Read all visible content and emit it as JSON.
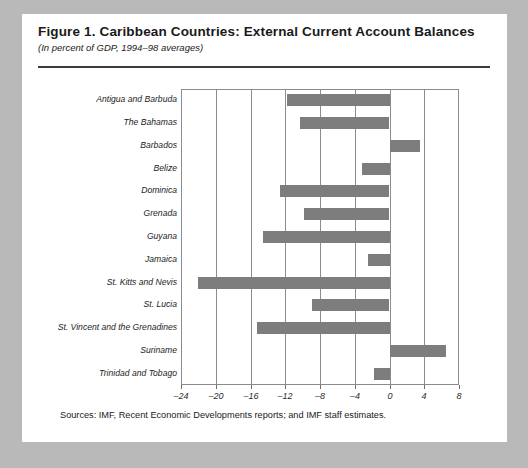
{
  "figure": {
    "title": "Figure 1.  Caribbean Countries: External Current Account Balances",
    "subtitle": "(In percent of GDP, 1994–98 averages)",
    "source_note": "Sources: IMF, Recent Economic Developments reports; and IMF staff estimates."
  },
  "colors": {
    "page_background": "#b9b9b9",
    "card_background": "#ffffff",
    "bar_fill": "#7d7d7d",
    "gridline": "#8c8c8c",
    "rule": "#3b3b3b",
    "text": "#1a1a1a"
  },
  "chart_data": {
    "type": "bar",
    "orientation": "horizontal",
    "title": "Figure 1.  Caribbean Countries: External Current Account Balances",
    "subtitle": "(In percent of GDP, 1994–98 averages)",
    "xlabel": "",
    "ylabel": "",
    "xlim": [
      -24,
      8
    ],
    "xticks": [
      -24,
      -20,
      -16,
      -12,
      -8,
      -4,
      0,
      4,
      8
    ],
    "xtick_labels": [
      "–24",
      "–20",
      "–16",
      "–12",
      "–8",
      "–4",
      "0",
      "4",
      "8"
    ],
    "grid": true,
    "legend": false,
    "categories": [
      "Antigua and Barbuda",
      "The Bahamas",
      "Barbados",
      "Belize",
      "Dominica",
      "Grenada",
      "Guyana",
      "Jamaica",
      "St. Kitts and Nevis",
      "St. Lucia",
      "St. Vincent and the Grenadines",
      "Suriname",
      "Trinidad and Tobago"
    ],
    "values": [
      -11.8,
      -10.3,
      3.4,
      -3.2,
      -12.6,
      -9.8,
      -14.6,
      -2.5,
      -22.1,
      -8.9,
      -15.3,
      6.5,
      -1.8
    ]
  }
}
